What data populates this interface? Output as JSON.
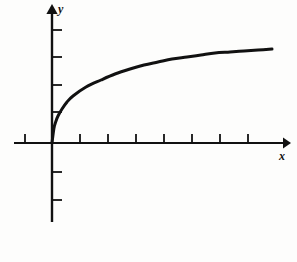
{
  "figure": {
    "name": "increasing-concave-curve-graph",
    "background_color": "#fdfdfc",
    "ink_color": "#111111"
  },
  "axes": {
    "x_label": "x",
    "y_label": "y",
    "origin_px": {
      "x": 52,
      "y": 143
    },
    "x_axis": {
      "start_px": 14,
      "end_px": 288,
      "arrow": "right-arrow",
      "tick_length_px": 9,
      "tick_positions_px": [
        25,
        80,
        108,
        136,
        164,
        192,
        220,
        248
      ]
    },
    "y_axis": {
      "top_px": 5,
      "bottom_px": 222,
      "arrow": "up-arrow",
      "tick_length_px": 10,
      "tick_positions_px": [
        30,
        57,
        85,
        112,
        172,
        200
      ]
    }
  },
  "chart_data": {
    "type": "line",
    "title": "",
    "xlabel": "x",
    "ylabel": "y",
    "grid": false,
    "legend": null,
    "curve_name": "increasing-concave-curve",
    "line_color": "#111111",
    "line_width_px": 3,
    "xlim": [
      0,
      8.4
    ],
    "ylim": [
      0,
      4.2
    ],
    "x": [
      0.0,
      0.1,
      0.2,
      0.3,
      0.5,
      0.75,
      1.0,
      1.5,
      2.0,
      2.5,
      3.0,
      3.5,
      4.0,
      4.5,
      5.0,
      5.5,
      6.0,
      6.5,
      7.0,
      7.5,
      7.9
    ],
    "y": [
      0.0,
      0.56,
      0.79,
      0.97,
      1.25,
      1.53,
      1.77,
      2.17,
      2.5,
      2.8,
      3.06,
      3.3,
      3.53,
      3.74,
      3.95,
      4.14,
      4.32,
      4.5,
      4.67,
      4.83,
      4.95
    ],
    "points_px": [
      {
        "x": 52,
        "y": 143
      },
      {
        "x": 54,
        "y": 128
      },
      {
        "x": 56,
        "y": 121
      },
      {
        "x": 58,
        "y": 116
      },
      {
        "x": 62,
        "y": 109
      },
      {
        "x": 67,
        "y": 102
      },
      {
        "x": 73,
        "y": 96
      },
      {
        "x": 86,
        "y": 87
      },
      {
        "x": 101,
        "y": 80
      },
      {
        "x": 115,
        "y": 74
      },
      {
        "x": 130,
        "y": 69
      },
      {
        "x": 144,
        "y": 65
      },
      {
        "x": 158,
        "y": 62
      },
      {
        "x": 172,
        "y": 59
      },
      {
        "x": 187,
        "y": 57
      },
      {
        "x": 201,
        "y": 55
      },
      {
        "x": 215,
        "y": 53
      },
      {
        "x": 230,
        "y": 52
      },
      {
        "x": 244,
        "y": 51
      },
      {
        "x": 258,
        "y": 50
      },
      {
        "x": 272,
        "y": 49
      }
    ]
  }
}
